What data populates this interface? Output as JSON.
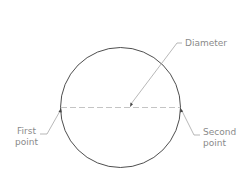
{
  "diagram": {
    "circle": {
      "cx": 120.5,
      "cy": 107.5,
      "r": 60,
      "stroke": "#3a3a3a"
    },
    "diameter_line": {
      "x1": 61,
      "y1": 107.5,
      "x2": 180,
      "y2": 107.5,
      "style": "dashed",
      "stroke": "#b0b0b0"
    },
    "labels": {
      "diameter": "Diameter",
      "first_point_line1": "First",
      "first_point_line2": "point",
      "second_point_line1": "Second",
      "second_point_line2": "point"
    },
    "colors": {
      "label_text": "#8a8a8a",
      "leader_line": "#8a8a8a",
      "circle": "#3a3a3a",
      "background": "#ffffff"
    }
  }
}
